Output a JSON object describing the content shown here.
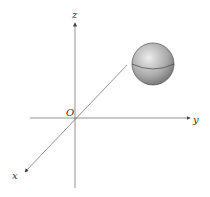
{
  "diagram": {
    "axes": {
      "z_label": "z",
      "y_label": "y",
      "x_label": "x",
      "origin_label": "O"
    },
    "colors": {
      "axis": "#555555",
      "sphere_light": "#e6e6e6",
      "sphere_dark": "#6a6a6a"
    }
  }
}
